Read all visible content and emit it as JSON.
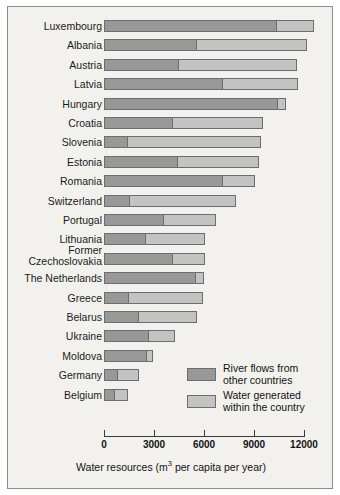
{
  "chart_data": {
    "type": "bar",
    "orientation": "horizontal",
    "stacked": true,
    "title": "",
    "xlabel": "Water resources (m3 per capita per year)",
    "xlabel_base": "Water resources (m",
    "xlabel_sup": "3",
    "xlabel_tail": " per capita per year)",
    "ylabel": "",
    "xlim": [
      0,
      12600
    ],
    "axis_max_tick": 12000,
    "grid": false,
    "legend_position": "inside-right-lower",
    "tick_values": [
      0,
      3000,
      6000,
      9000,
      12000
    ],
    "tick_labels": [
      "0",
      "3000",
      "6000",
      "9000",
      "12000"
    ],
    "categories": [
      "Luxembourg",
      "Albania",
      "Austria",
      "Latvia",
      "Hungary",
      "Croatia",
      "Slovenia",
      "Estonia",
      "Romania",
      "Switzerland",
      "Portugal",
      "Lithuania",
      "Former Czechoslovakia",
      "The Netherlands",
      "Greece",
      "Belarus",
      "Ukraine",
      "Moldova",
      "Germany",
      "Belgium"
    ],
    "series": [
      {
        "name": "River flows from other countries",
        "color": "#989898",
        "values": [
          10380,
          5580,
          4500,
          7140,
          10440,
          4140,
          1440,
          4440,
          7140,
          1560,
          3600,
          2520,
          4140,
          5520,
          1500,
          2100,
          2700,
          2580,
          840,
          660
        ]
      },
      {
        "name": "Water generated within the country",
        "color": "#c3c3c3",
        "values": [
          2220,
          6600,
          7080,
          4500,
          480,
          5400,
          7980,
          4860,
          1920,
          6360,
          3120,
          3540,
          1920,
          480,
          4440,
          3480,
          1560,
          360,
          1260,
          780
        ]
      }
    ],
    "totals": [
      12600,
      12180,
      11580,
      11640,
      10920,
      9540,
      9420,
      9300,
      9060,
      7920,
      6720,
      6060,
      6060,
      6000,
      5940,
      5580,
      4260,
      2940,
      2100,
      1440
    ]
  },
  "legend": {
    "entries": [
      {
        "label_line1": "River flows from",
        "label_line2": "other countries",
        "swatch": "dark"
      },
      {
        "label_line1": "Water generated",
        "label_line2": "within the country",
        "swatch": "light"
      }
    ]
  },
  "colors": {
    "dark_segment": "#989898",
    "light_segment": "#c3c3c3",
    "segment_border": "#6d6d6d",
    "plot_background": "#f2f1ee",
    "frame_border": "#8d8d8d",
    "text": "#121212"
  }
}
